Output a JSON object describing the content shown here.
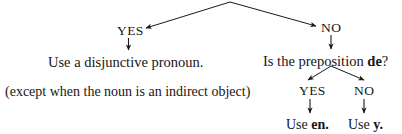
{
  "diagram": {
    "type": "decision-tree",
    "title": "",
    "background_color": "#ffffff",
    "ink_color": "#161616",
    "root": {
      "apex_label": ""
    },
    "nodes": {
      "yes_top": "YES",
      "no_top": "NO",
      "disjunctive": "Use a disjunctive pronoun.",
      "except_note": "(except when the noun is an indirect object)",
      "question_de_prefix": "Is the preposition ",
      "question_de_keyword": "de",
      "question_de_suffix": "?",
      "yes_bottom": "YES",
      "no_bottom": "NO",
      "use_prefix_en": "Use ",
      "keyword_en": "en",
      "period_en": ".",
      "use_prefix_y": "Use ",
      "keyword_y": "y",
      "period_y": "."
    },
    "edges": [
      {
        "name": "root-to-yes",
        "from": "apex",
        "to": "yes_top",
        "style": "arrow"
      },
      {
        "name": "root-to-no",
        "from": "apex",
        "to": "no_top",
        "style": "arrow"
      },
      {
        "name": "yes-to-disjunctive",
        "from": "yes_top",
        "to": "disjunctive",
        "style": "arrow"
      },
      {
        "name": "no-to-question",
        "from": "no_top",
        "to": "question_de",
        "style": "arrow"
      },
      {
        "name": "question-to-yes",
        "from": "question_de",
        "to": "yes_bottom",
        "style": "arrow"
      },
      {
        "name": "question-to-no",
        "from": "question_de",
        "to": "no_bottom",
        "style": "arrow"
      },
      {
        "name": "yes-to-use-en",
        "from": "yes_bottom",
        "to": "use_en",
        "style": "arrow"
      },
      {
        "name": "no-to-use-y",
        "from": "no_bottom",
        "to": "use_y",
        "style": "arrow"
      }
    ]
  }
}
